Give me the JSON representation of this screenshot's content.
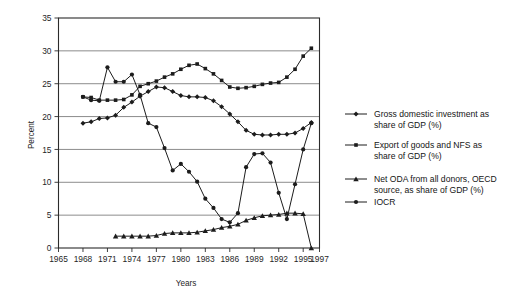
{
  "chart_data": {
    "type": "line",
    "title": "",
    "xlabel": "Years",
    "ylabel": "Percent",
    "xlim": [
      1965,
      1997
    ],
    "ylim": [
      0,
      35
    ],
    "ytick_labels": [
      "0",
      "5",
      "10",
      "15",
      "20",
      "25",
      "30",
      "35"
    ],
    "ytick_values": [
      0,
      5,
      10,
      15,
      20,
      25,
      30,
      35
    ],
    "xtick_labels": [
      "1965",
      "1968",
      "1971",
      "1974",
      "1977",
      "1980",
      "1983",
      "1986",
      "1989",
      "1992",
      "1995",
      "1997"
    ],
    "xtick_values": [
      1965,
      1968,
      1971,
      1974,
      1977,
      1980,
      1983,
      1986,
      1989,
      1992,
      1995,
      1997
    ],
    "grid": true,
    "grid_axis": "y",
    "legend_position": "right",
    "series": [
      {
        "name": "Gross domestic investment as share of GDP (%)",
        "marker": "diamond",
        "x": [
          1968,
          1969,
          1970,
          1971,
          1972,
          1973,
          1974,
          1975,
          1976,
          1977,
          1978,
          1979,
          1980,
          1981,
          1982,
          1983,
          1984,
          1985,
          1986,
          1987,
          1988,
          1989,
          1990,
          1991,
          1992,
          1993,
          1994,
          1995,
          1996
        ],
        "values": [
          19.0,
          19.2,
          19.7,
          19.8,
          20.2,
          21.4,
          22.2,
          23.1,
          23.8,
          24.5,
          24.4,
          23.8,
          23.2,
          23.0,
          23.0,
          22.9,
          22.4,
          21.5,
          20.4,
          19.2,
          17.9,
          17.3,
          17.2,
          17.2,
          17.3,
          17.3,
          17.5,
          18.2,
          19.1
        ]
      },
      {
        "name": "Export of goods and NFS as share of GDP (%)",
        "marker": "square",
        "x": [
          1968,
          1969,
          1970,
          1971,
          1972,
          1973,
          1974,
          1975,
          1976,
          1977,
          1978,
          1979,
          1980,
          1981,
          1982,
          1983,
          1984,
          1985,
          1986,
          1987,
          1988,
          1989,
          1990,
          1991,
          1992,
          1993,
          1994,
          1995,
          1996
        ],
        "values": [
          23.0,
          22.9,
          22.5,
          22.5,
          22.5,
          22.6,
          23.3,
          24.6,
          25.0,
          25.4,
          26.0,
          26.5,
          27.2,
          27.8,
          28.0,
          27.3,
          26.5,
          25.5,
          24.5,
          24.3,
          24.4,
          24.6,
          24.9,
          25.1,
          25.2,
          26.0,
          27.2,
          29.2,
          30.4
        ]
      },
      {
        "name": "Net ODA from all donors, OECD source, as share of GDP (%)",
        "marker": "triangle",
        "x": [
          1972,
          1973,
          1974,
          1975,
          1976,
          1977,
          1978,
          1979,
          1980,
          1981,
          1982,
          1983,
          1984,
          1985,
          1986,
          1987,
          1988,
          1989,
          1990,
          1991,
          1992,
          1993,
          1994,
          1995,
          1996
        ],
        "values": [
          1.8,
          1.8,
          1.8,
          1.8,
          1.8,
          1.9,
          2.2,
          2.3,
          2.3,
          2.3,
          2.4,
          2.6,
          2.8,
          3.1,
          3.3,
          3.6,
          4.2,
          4.6,
          4.9,
          5.0,
          5.1,
          5.3,
          5.3,
          5.2,
          0.0
        ]
      },
      {
        "name": "IOCR",
        "marker": "circle",
        "x": [
          1968,
          1969,
          1970,
          1971,
          1972,
          1973,
          1974,
          1975,
          1976,
          1977,
          1978,
          1979,
          1980,
          1981,
          1982,
          1983,
          1984,
          1985,
          1986,
          1987,
          1988,
          1989,
          1990,
          1991,
          1992,
          1993,
          1994,
          1995,
          1996
        ],
        "values": [
          23.0,
          22.5,
          22.4,
          27.5,
          25.3,
          25.3,
          26.4,
          23.3,
          19.0,
          18.4,
          15.2,
          11.8,
          12.8,
          11.6,
          10.1,
          7.5,
          6.1,
          4.4,
          3.9,
          5.3,
          12.3,
          14.3,
          14.4,
          13.0,
          8.4,
          4.4,
          9.7,
          15.0,
          19.0
        ]
      }
    ]
  },
  "legend": {
    "entries": [
      {
        "label_line1": "Gross domestic investment as",
        "label_line2": "share of GDP (%)",
        "marker": "diamond"
      },
      {
        "label_line1": "Export of goods and NFS as",
        "label_line2": "share of GDP (%)",
        "marker": "square"
      },
      {
        "label_line1": "Net ODA from all donors, OECD",
        "label_line2": "source, as share of GDP (%)",
        "marker": "triangle"
      },
      {
        "label_line1": "IOCR",
        "label_line2": "",
        "marker": "circle"
      }
    ]
  },
  "colors": {
    "ink": "#1c1c1c",
    "grid": "#6f6f6f",
    "frame": "#2b2b2b",
    "background": "#ffffff"
  }
}
